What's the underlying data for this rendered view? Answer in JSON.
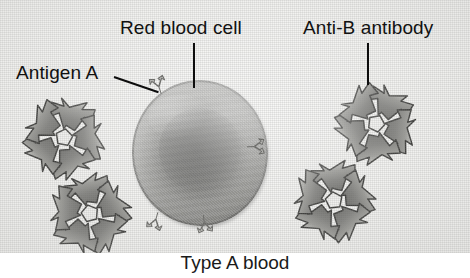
{
  "figure": {
    "caption": "Type A blood",
    "background_color": "#f2f2f0",
    "ink_color": "#111111"
  },
  "labels": {
    "red_blood_cell": "Red blood cell",
    "anti_b_antibody": "Anti-B antibody",
    "antigen_a": "Antigen A"
  },
  "cell": {
    "name": "red-blood-cell",
    "shape": "biconcave disc",
    "fill_color": "#7b7b78",
    "center_color": "#5e5e5c"
  },
  "antigens": {
    "name": "antigen-a-spike",
    "count": 4,
    "color": "#b9b9b5"
  },
  "antibodies": {
    "name": "anti-b-antibody",
    "count": 4,
    "arms": 5,
    "body_color": "#8e8e8a",
    "outline_color": "#3f3f3d",
    "center_color": "#f0f0ee"
  }
}
